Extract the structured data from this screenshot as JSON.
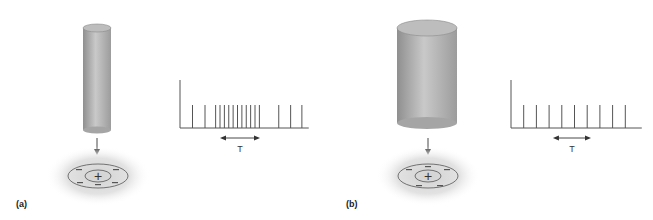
{
  "figure": {
    "panels": [
      {
        "id": "a",
        "label": "(a)",
        "stimulus": "thin-cylinder",
        "receptive_field": {
          "center_sign": "+",
          "surround_sign": "−"
        },
        "spike_train": {
          "period_label": "T",
          "spike_times": [
            1,
            2,
            2.85,
            3.2,
            3.55,
            3.9,
            4.25,
            4.6,
            4.95,
            5.3,
            5.65,
            6.0,
            6.35,
            7.9,
            8.85,
            9.75
          ],
          "baseline_start": 0,
          "baseline_end": 10.3,
          "period_arrow": [
            3.2,
            6.4
          ]
        }
      },
      {
        "id": "b",
        "label": "(b)",
        "stimulus": "wide-cylinder",
        "receptive_field": {
          "center_sign": "+",
          "surround_sign": "−"
        },
        "spike_train": {
          "period_label": "T",
          "spike_times": [
            1,
            2,
            3,
            4,
            5,
            6,
            7,
            8,
            9
          ],
          "baseline_start": 0,
          "baseline_end": 10.3,
          "period_arrow": [
            3.3,
            6.3
          ]
        }
      }
    ]
  },
  "colors": {
    "line": "#555555",
    "cylinder_dark": "#9a9a9a",
    "cylinder_light": "#c8c8c8",
    "glow": "#d6d6d6"
  }
}
